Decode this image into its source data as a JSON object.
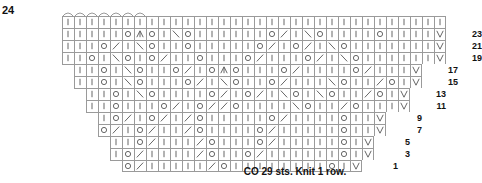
{
  "chart_title_label": "24",
  "caption": "CO 29 sts. Knit 1 row.",
  "symbols": {
    "knit": "|",
    "yarnover": "O",
    "k2tog": "/",
    "ssk": "\\",
    "cdd": "∧",
    "slip": "V",
    "empty": ""
  },
  "colors": {
    "grid_line": "#9a9a9a",
    "symbol": "#555555",
    "text": "#111111",
    "background": "#ffffff"
  },
  "axis": {
    "top_row_label": "24",
    "right_row_labels": [
      "23",
      "21",
      "19",
      "17",
      "15",
      "13",
      "11",
      "9",
      "7",
      "5",
      "3",
      "1"
    ]
  },
  "chart_data": {
    "type": "table",
    "subtitle": "CO 29 sts. Knit 1 row.",
    "xlabel": "",
    "ylabel": "",
    "grid": true,
    "legend": "none",
    "cell_width_px": 12,
    "cell_height_px": 12,
    "row_count": 13,
    "symbol_key": {
      "|": "knit",
      "O": "yarn over",
      "/": "k2tog",
      "\\": "ssk",
      "∧": "central double decrease",
      "V": "slip stitch"
    },
    "rows": [
      {
        "label": "24",
        "indent_px": 62,
        "cells": [
          "|",
          "|",
          "|",
          "|",
          "|",
          "|",
          "|",
          "|",
          "|",
          "|",
          "|",
          "|",
          "|",
          "|",
          "|",
          "|",
          "|",
          "|",
          "|",
          "|",
          "|",
          "|",
          "|",
          "|",
          "|",
          "|",
          "|",
          "|",
          "|",
          "|",
          "|",
          "|"
        ]
      },
      {
        "label": "23",
        "indent_px": 62,
        "cells": [
          "|",
          "|",
          "|",
          "|",
          "|",
          "O",
          "∧",
          "O",
          "|",
          "\\",
          "O",
          "|",
          "|",
          "|",
          "|",
          "|",
          "|",
          "O",
          "/",
          "|",
          "\\",
          "O",
          "|",
          "|",
          "|",
          "|",
          "O",
          "|",
          "|",
          "|",
          "|",
          "V"
        ]
      },
      {
        "label": "21",
        "indent_px": 62,
        "cells": [
          "|",
          "|",
          "|",
          "O",
          "/",
          "|",
          "\\",
          "O",
          "|",
          "|",
          "O",
          "|",
          "|",
          "|",
          "|",
          "|",
          "O",
          "/",
          "|",
          "O",
          "/",
          "|",
          "\\",
          "O",
          "|",
          "|",
          "|",
          "|",
          "|",
          "|",
          "|",
          "V"
        ]
      },
      {
        "label": "19",
        "indent_px": 62,
        "cells": [
          "|",
          "|",
          "O",
          "|",
          "\\",
          "O",
          "|",
          "O",
          "/",
          "|",
          "|",
          "O",
          "|",
          "|",
          "|",
          "O",
          "/",
          "|",
          "|",
          "|",
          "O",
          "/",
          "|",
          "\\",
          "O",
          "|",
          "|",
          "|",
          "|",
          "|",
          "|",
          "V"
        ]
      },
      {
        "label": "17",
        "indent_px": 74,
        "cells": [
          "|",
          "|",
          "O",
          "|",
          "\\",
          "O",
          "|",
          "|",
          "O",
          "/",
          "|",
          "O",
          "∧",
          "O",
          "|",
          "|",
          "|",
          "O",
          "/",
          "|",
          "|",
          "|",
          "|",
          "O",
          "/",
          "|",
          "|",
          "|",
          "V"
        ]
      },
      {
        "label": "15",
        "indent_px": 74,
        "cells": [
          "|",
          "|",
          "O",
          "|",
          "\\",
          "O",
          "|",
          "|",
          "|",
          "O",
          "/",
          "|",
          "\\",
          "O",
          "|",
          "|",
          "O",
          "/",
          "|",
          "|",
          "|",
          "\\",
          "O",
          "|",
          "|",
          "/",
          "O",
          "|",
          "V"
        ]
      },
      {
        "label": "13",
        "indent_px": 86,
        "cells": [
          "|",
          "|",
          "O",
          "|",
          "\\",
          "O",
          "|",
          "|",
          "|",
          "|",
          "O",
          "/",
          "|",
          "O",
          "/",
          "|",
          "\\",
          "O",
          "|",
          "\\",
          "O",
          "|",
          "|",
          "/",
          "O",
          "|",
          "V"
        ]
      },
      {
        "label": "11",
        "indent_px": 86,
        "cells": [
          "|",
          "|",
          "O",
          "|",
          "|",
          "|",
          "O",
          "/",
          "|",
          "O",
          "/",
          "/",
          "O",
          "|",
          "|",
          "|",
          "|",
          "\\",
          "O",
          "|",
          "|",
          "/",
          "O",
          "|",
          "|",
          "|",
          "V"
        ]
      },
      {
        "label": "9",
        "indent_px": 98,
        "cells": [
          "|",
          "O",
          "/",
          "|",
          "O",
          "/",
          "|",
          "/",
          "O",
          "|",
          "|",
          "|",
          "|",
          "|",
          "O",
          "/",
          "|",
          "|",
          "|",
          "|",
          "O",
          "|",
          "|",
          "V"
        ]
      },
      {
        "label": "7",
        "indent_px": 98,
        "cells": [
          "O",
          "/",
          "|",
          "O",
          "/",
          "|",
          "|",
          "/",
          "O",
          "|",
          "|",
          "|",
          "|",
          "O",
          "/",
          "|",
          "|",
          "|",
          "|",
          "|",
          "O",
          "|",
          "|",
          "V"
        ]
      },
      {
        "label": "5",
        "indent_px": 110,
        "cells": [
          "|",
          "|",
          "O",
          "/",
          "|",
          "|",
          "|",
          "/",
          "O",
          "|",
          "|",
          "|",
          "O",
          "/",
          "|",
          "|",
          "|",
          "|",
          "|",
          "O",
          "|",
          "V"
        ]
      },
      {
        "label": "3",
        "indent_px": 110,
        "cells": [
          "|",
          "O",
          "/",
          "|",
          "|",
          "|",
          "|",
          "/",
          "O",
          "|",
          "|",
          "O",
          "/",
          "|",
          "|",
          "|",
          "|",
          "|",
          "|",
          "O",
          "|",
          "V"
        ]
      },
      {
        "label": "1",
        "indent_px": 122,
        "cells": [
          "O",
          "/",
          "|",
          "|",
          "|",
          "|",
          "|",
          "/",
          "O",
          "|",
          "|",
          "|",
          "|",
          "|",
          "|",
          "|",
          "|",
          "O",
          "|",
          "V"
        ]
      }
    ]
  }
}
